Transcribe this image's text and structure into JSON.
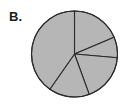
{
  "figure": {
    "panel_label": "B.",
    "background_color": "#ffffff"
  },
  "chart_data": {
    "type": "pie",
    "title": "B.",
    "xlabel": "",
    "ylabel": "",
    "grid": false,
    "legend": "none",
    "center_x": 74.5,
    "center_y": 54,
    "radius": 43,
    "fill_color": "#b6b6b6",
    "stroke_color": "#2b2b2b",
    "stroke_width": 1.1,
    "start_angle_deg": 0,
    "direction": "clockwise",
    "labels": [
      "Slice 1",
      "Slice 2",
      "Slice 3",
      "Slice 4",
      "Slice 5"
    ],
    "boundary_angles_deg": [
      0,
      67,
      95,
      160,
      215,
      360
    ],
    "angles_deg": [
      67,
      28,
      65,
      55,
      145
    ],
    "values": [
      18.6,
      7.8,
      18.1,
      15.3,
      40.3
    ],
    "tick_labels": [],
    "annotations": []
  }
}
